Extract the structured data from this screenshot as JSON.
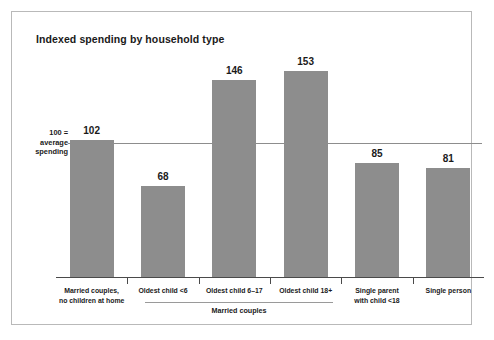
{
  "chart_data": {
    "type": "bar",
    "title": "Indexed spending by household type",
    "xlabel": "",
    "ylabel": "",
    "ylim": [
      0,
      170
    ],
    "grid": false,
    "legend": null,
    "reference_line": {
      "value": 100,
      "label_lines": [
        "100 =",
        "average",
        "spending"
      ]
    },
    "group_annotations": [
      {
        "label": "Married couples",
        "covers": [
          "Oldest child <6",
          "Oldest child 6–17",
          "Oldest child 18+"
        ]
      }
    ],
    "categories": [
      "Married couples, no children at home",
      "Oldest child <6",
      "Oldest child 6–17",
      "Oldest child 18+",
      "Single parent with child <18",
      "Single person"
    ],
    "category_label_lines": [
      [
        "Married couples,",
        "no children at home"
      ],
      [
        "Oldest child <6"
      ],
      [
        "Oldest child 6–17"
      ],
      [
        "Oldest child 18+"
      ],
      [
        "Single parent",
        "with child <18"
      ],
      [
        "Single person"
      ]
    ],
    "values": [
      102,
      68,
      146,
      153,
      85,
      81
    ],
    "value_labels": [
      "102",
      "68",
      "146",
      "153",
      "85",
      "81"
    ],
    "colors": {
      "bar": "#8d8d8d",
      "axis": "#4a4a4a",
      "reference_line": "#8d8d8d",
      "frame": "#b9b9b9",
      "background": "#ffffff",
      "text": "#1a1a1a"
    }
  }
}
